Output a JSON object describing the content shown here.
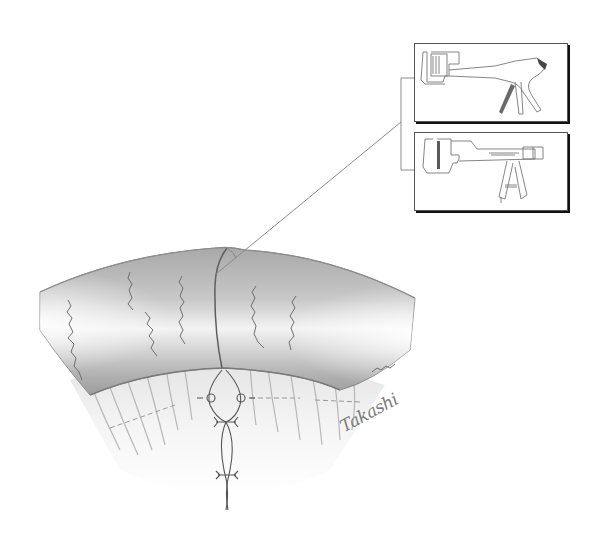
{
  "figure": {
    "type": "surgical-illustration",
    "background_color": "#ffffff",
    "tissue_shade_dark": "#9a9a9a",
    "tissue_shade_light": "#f2f2f2",
    "line_color": "#6b6b6b"
  },
  "callout": {
    "leader_from": [
      401,
      122
    ],
    "leader_to": [
      216,
      274
    ],
    "bracket_x": 401,
    "bracket_top_y": 78,
    "bracket_bottom_y": 170
  },
  "insets": [
    {
      "id": "inset-1",
      "label": "Linear stapler (pistol-grip)",
      "icon": "linear-stapler-icon",
      "x": 414,
      "y": 43,
      "w": 152,
      "h": 77,
      "accent": "#555555"
    },
    {
      "id": "inset-2",
      "label": "Linear cutting stapler (long shaft)",
      "icon": "linear-cutter-stapler-icon",
      "x": 414,
      "y": 132,
      "w": 152,
      "h": 77,
      "accent": "#555555"
    }
  ],
  "signature": {
    "text": "Takashi"
  }
}
